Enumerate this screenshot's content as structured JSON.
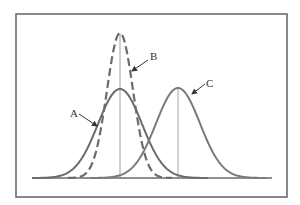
{
  "diagram": {
    "type": "distribution-curves",
    "frame": {
      "x": 16,
      "y": 14,
      "width": 271,
      "height": 183,
      "stroke": "#6b6b6b"
    },
    "baseline": {
      "x1": 33,
      "x2": 272,
      "y": 178,
      "stroke": "#6b6b6b"
    },
    "curves": [
      {
        "id": "A",
        "label": "A",
        "style": "solid",
        "color": "#6b6b6b",
        "center_x": 120,
        "peak_y": 89,
        "sigma": 22,
        "label_pos": {
          "x": 70,
          "y": 117
        },
        "arrow": {
          "x1": 79,
          "y1": 114,
          "x2": 97,
          "y2": 126
        }
      },
      {
        "id": "B",
        "label": "B",
        "style": "dashed",
        "color": "#6b6b6b",
        "center_x": 120,
        "peak_y": 33,
        "sigma": 13,
        "label_pos": {
          "x": 150,
          "y": 60
        },
        "arrow": {
          "x1": 148,
          "y1": 60,
          "x2": 132,
          "y2": 71
        }
      },
      {
        "id": "C",
        "label": "C",
        "style": "solid",
        "color": "#7a7a7a",
        "center_x": 178,
        "peak_y": 88,
        "sigma": 22,
        "label_pos": {
          "x": 206,
          "y": 87
        },
        "arrow": {
          "x1": 205,
          "y1": 84,
          "x2": 192,
          "y2": 94
        }
      }
    ],
    "vertical_lines": [
      {
        "x": 120,
        "y1": 33,
        "y2": 178
      },
      {
        "x": 178,
        "y1": 88,
        "y2": 178
      }
    ]
  }
}
